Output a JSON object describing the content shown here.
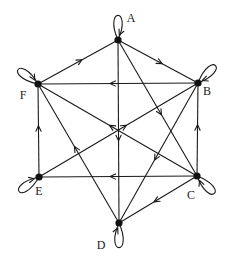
{
  "diagram": {
    "type": "directed-graph",
    "nodes": [
      {
        "id": "A",
        "label": "A",
        "x": 118,
        "y": 40,
        "lx": 131,
        "ly": 22,
        "self_loop": true
      },
      {
        "id": "B",
        "label": "B",
        "x": 198,
        "y": 83,
        "lx": 207,
        "ly": 95,
        "self_loop": true
      },
      {
        "id": "C",
        "label": "C",
        "x": 197,
        "y": 176,
        "lx": 191,
        "ly": 199,
        "self_loop": true
      },
      {
        "id": "D",
        "label": "D",
        "x": 119,
        "y": 223,
        "lx": 101,
        "ly": 249,
        "self_loop": true
      },
      {
        "id": "E",
        "label": "E",
        "x": 39,
        "y": 177,
        "lx": 39,
        "ly": 195,
        "self_loop": true
      },
      {
        "id": "F",
        "label": "F",
        "x": 38,
        "y": 84,
        "lx": 23,
        "ly": 99,
        "self_loop": true
      }
    ],
    "edges": [
      {
        "from": "F",
        "to": "A"
      },
      {
        "from": "A",
        "to": "B"
      },
      {
        "from": "B",
        "to": "F"
      },
      {
        "from": "A",
        "to": "D"
      },
      {
        "from": "A",
        "to": "C"
      },
      {
        "from": "C",
        "to": "F"
      },
      {
        "from": "E",
        "to": "B"
      },
      {
        "from": "B",
        "to": "D"
      },
      {
        "from": "C",
        "to": "B"
      },
      {
        "from": "E",
        "to": "F"
      },
      {
        "from": "D",
        "to": "F"
      },
      {
        "from": "C",
        "to": "E"
      },
      {
        "from": "C",
        "to": "D"
      }
    ],
    "self_loops": [
      "A",
      "B",
      "C",
      "D",
      "E",
      "F"
    ]
  }
}
